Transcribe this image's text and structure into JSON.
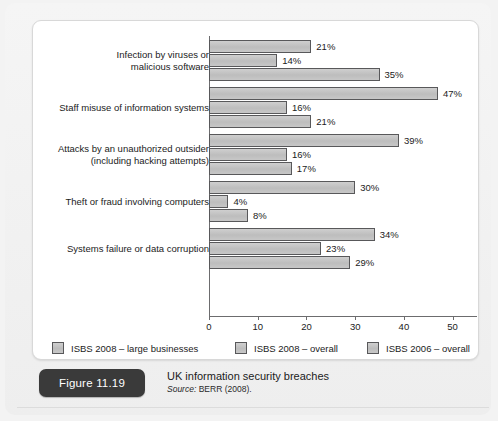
{
  "figure": {
    "pill_label": "Figure 11.19",
    "title": "UK information security breaches",
    "source_label": "Source:",
    "source_text": "BERR (2008)."
  },
  "chart_data": {
    "type": "bar",
    "orientation": "horizontal",
    "title": "UK information security breaches",
    "xlabel": "",
    "ylabel": "",
    "xlim": [
      0,
      55
    ],
    "xticks": [
      0,
      10,
      20,
      30,
      40,
      50
    ],
    "xtick_labels": [
      "0",
      "10",
      "20",
      "30",
      "40",
      "50"
    ],
    "grid": false,
    "legend_position": "bottom",
    "value_label_suffix": "%",
    "categories": [
      "Infection by viruses or\nmalicious software",
      "Staff misuse of information systems",
      "Attacks by an unauthorized outsider\n(including hacking attempts)",
      "Theft or fraud involving computers",
      "Systems failure or data corruption"
    ],
    "series": [
      {
        "name": "ISBS 2008 – large businesses",
        "color": "#c4c4c4",
        "values": [
          21,
          47,
          39,
          30,
          34
        ],
        "labels": [
          "21%",
          "47%",
          "39%",
          "30%",
          "34%"
        ]
      },
      {
        "name": "ISBS 2008 – overall",
        "color": "#c4c4c4",
        "values": [
          14,
          16,
          16,
          4,
          23
        ],
        "labels": [
          "14%",
          "16%",
          "16%",
          "4%",
          "23%"
        ]
      },
      {
        "name": "ISBS 2006 – overall",
        "color": "#c4c4c4",
        "values": [
          35,
          21,
          17,
          8,
          29
        ],
        "labels": [
          "35%",
          "21%",
          "17%",
          "8%",
          "29%"
        ]
      }
    ]
  }
}
